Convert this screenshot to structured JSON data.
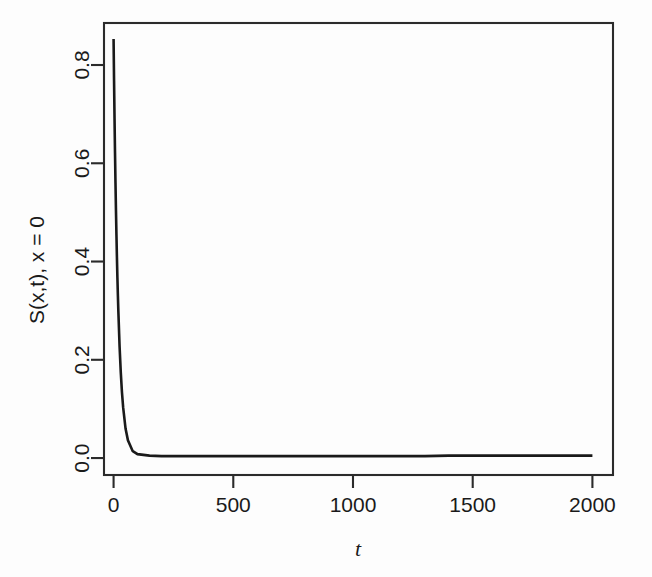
{
  "figure": {
    "width": 652,
    "height": 577,
    "background_color": "#fdfdfd",
    "line_color": "#1a1a1a",
    "axis_color": "#2b2b2b"
  },
  "chart_data": {
    "type": "line",
    "title": "",
    "xlabel": "t",
    "ylabel": "S(x,t), x = 0",
    "xlim": [
      -40,
      2086
    ],
    "ylim": [
      -0.0345,
      0.8855
    ],
    "grid": false,
    "legend": false,
    "xticks": [
      0,
      500,
      1000,
      1500,
      2000
    ],
    "xtick_labels": [
      "0",
      "500",
      "1000",
      "1500",
      "2000"
    ],
    "yticks": [
      0.0,
      0.2,
      0.4,
      0.6,
      0.8
    ],
    "ytick_labels": [
      "0.0",
      "0.2",
      "0.4",
      "0.6",
      "0.8"
    ],
    "series": [
      {
        "name": "S(x,t) at x = 0",
        "x": [
          0,
          2,
          4,
          6,
          8,
          10,
          12,
          14,
          16,
          18,
          20,
          25,
          30,
          35,
          40,
          50,
          60,
          80,
          100,
          150,
          200,
          300,
          400,
          500,
          600,
          700,
          800,
          900,
          1000,
          1100,
          1200,
          1300,
          1400,
          1500,
          1600,
          1700,
          1800,
          1900,
          2000
        ],
        "y": [
          0.853,
          0.768,
          0.691,
          0.622,
          0.56,
          0.504,
          0.454,
          0.408,
          0.367,
          0.331,
          0.298,
          0.228,
          0.175,
          0.134,
          0.103,
          0.06,
          0.036,
          0.014,
          0.008,
          0.005,
          0.004,
          0.004,
          0.004,
          0.004,
          0.004,
          0.004,
          0.004,
          0.004,
          0.004,
          0.004,
          0.004,
          0.004,
          0.005,
          0.005,
          0.005,
          0.005,
          0.005,
          0.005,
          0.005
        ]
      }
    ],
    "annotations": []
  },
  "axis_labels": {
    "y_axis_title": "S(x,t), x = 0",
    "x_axis_title": "t"
  }
}
